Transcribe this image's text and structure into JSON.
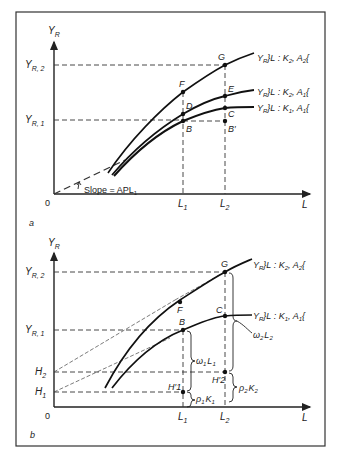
{
  "figure": {
    "panels": [
      {
        "id": "a",
        "panel_label": "a",
        "y_axis_label": "Y",
        "y_axis_sub": "R",
        "x_axis_label": "L",
        "origin_label": "0",
        "y_ticks": [
          {
            "main": "Y",
            "sub": "R, 2"
          },
          {
            "main": "Y",
            "sub": "R, 1"
          }
        ],
        "x_ticks": [
          {
            "main": "L",
            "sub": "1"
          },
          {
            "main": "L",
            "sub": "2"
          }
        ],
        "slope_label": "Slope = APL",
        "slope_sub": "1",
        "points": [
          "G",
          "F",
          "E",
          "D",
          "C",
          "B",
          "B′"
        ],
        "curves": [
          {
            "label_prefix": "Y",
            "label_sub": "R",
            "label_rest": "}L : K",
            "k_sub": "2",
            "mid": ", A",
            "a_sub": "2",
            "close": "{"
          },
          {
            "label_prefix": "Y",
            "label_sub": "R",
            "label_rest": "}L : K",
            "k_sub": "2",
            "mid": ", A",
            "a_sub": "1",
            "close": "{"
          },
          {
            "label_prefix": "Y",
            "label_sub": "R",
            "label_rest": "}L : K",
            "k_sub": "1",
            "mid": ", A",
            "a_sub": "1",
            "close": "{"
          }
        ]
      },
      {
        "id": "b",
        "panel_label": "b",
        "y_axis_label": "Y",
        "y_axis_sub": "R",
        "x_axis_label": "L",
        "origin_label": "0",
        "y_ticks": [
          {
            "main": "Y",
            "sub": "R, 2"
          },
          {
            "main": "Y",
            "sub": "R, 1"
          },
          {
            "main": "H",
            "sub": "2"
          },
          {
            "main": "H",
            "sub": "1"
          }
        ],
        "x_ticks": [
          {
            "main": "L",
            "sub": "1"
          },
          {
            "main": "L",
            "sub": "2"
          }
        ],
        "points": [
          "G",
          "F",
          "C",
          "B",
          "H′1",
          "H′2"
        ],
        "curves": [
          {
            "label_prefix": "Y",
            "label_sub": "R",
            "label_rest": "}L : K",
            "k_sub": "2",
            "mid": ", A",
            "a_sub": "2",
            "close": "{"
          },
          {
            "label_prefix": "Y",
            "label_sub": "R",
            "label_rest": "}L : K",
            "k_sub": "1",
            "mid": ", A",
            "a_sub": "1",
            "close": "{"
          }
        ],
        "braces": [
          {
            "main": "ω",
            "sub": "1",
            "tail": "L",
            "tail_sub": "1"
          },
          {
            "main": "ρ",
            "sub": "1",
            "tail": "K",
            "tail_sub": "1"
          },
          {
            "main": "ω",
            "sub": "2",
            "tail": "L",
            "tail_sub": "2"
          },
          {
            "main": "ρ",
            "sub": "2",
            "tail": "K",
            "tail_sub": "2"
          }
        ]
      }
    ]
  }
}
